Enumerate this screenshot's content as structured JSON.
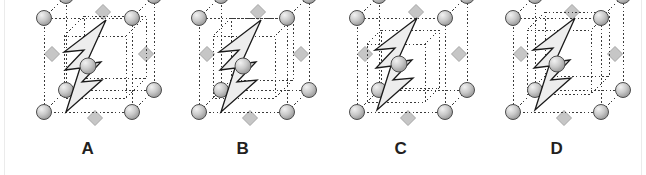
{
  "figure": {
    "background_color": "#ffffff",
    "width": 646,
    "height": 175,
    "edge_rule_color": "#ebebeb"
  },
  "style": {
    "sphere_fill_light": "#f2f2f2",
    "sphere_fill_mid": "#c9c9c9",
    "sphere_fill_dark": "#9a9a9a",
    "sphere_stroke": "#4d4d4d",
    "diamond_fill": "#c6c6c6",
    "diamond_stroke": "#a6a6a6",
    "cell_line_color": "#3a3a3a",
    "bolt_fill": "#ededed",
    "bolt_stroke": "#1a1a1a",
    "label_color": "#231f20"
  },
  "panels": [
    {
      "id": "panel-a",
      "label": "A",
      "left": 8,
      "outer_cell": {
        "x": 36,
        "y": 18,
        "w": 88,
        "h": 94,
        "shear_x": -22,
        "shear_y": 22
      },
      "inner_cell": {
        "x": 56,
        "y": 36,
        "w": 62,
        "h": 62,
        "shear_x": -20,
        "shear_y": 20
      },
      "corner_spheres": 8,
      "face_diamonds": 4,
      "bolt": {
        "cx": 80,
        "cy": 66,
        "scale": 1.0
      },
      "center_sphere": true
    },
    {
      "id": "panel-b",
      "label": "B",
      "left": 163,
      "outer_cell": {
        "x": 36,
        "y": 18,
        "w": 88,
        "h": 94,
        "shear_x": -22,
        "shear_y": 22
      },
      "inner_cell": {
        "x": 50,
        "y": 36,
        "w": 62,
        "h": 62,
        "shear_x": -18,
        "shear_y": 18
      },
      "corner_spheres": 8,
      "face_diamonds": 4,
      "bolt": {
        "cx": 80,
        "cy": 66,
        "scale": 1.0
      },
      "center_sphere": true
    },
    {
      "id": "panel-c",
      "label": "C",
      "left": 321,
      "outer_cell": {
        "x": 36,
        "y": 18,
        "w": 88,
        "h": 94,
        "shear_x": -22,
        "shear_y": 22
      },
      "inner_cell": {
        "x": 46,
        "y": 44,
        "w": 58,
        "h": 58,
        "shear_x": -14,
        "shear_y": 14
      },
      "corner_spheres": 8,
      "face_diamonds": 4,
      "bolt": {
        "cx": 78,
        "cy": 64,
        "scale": 1.0
      },
      "center_sphere": true
    },
    {
      "id": "panel-d",
      "label": "D",
      "left": 477,
      "outer_cell": {
        "x": 36,
        "y": 18,
        "w": 88,
        "h": 94,
        "shear_x": -22,
        "shear_y": 22
      },
      "inner_cell": {
        "x": 50,
        "y": 30,
        "w": 64,
        "h": 64,
        "shear_x": -18,
        "shear_y": 18
      },
      "corner_spheres": 8,
      "face_diamonds": 4,
      "bolt": {
        "cx": 80,
        "cy": 64,
        "scale": 1.0
      },
      "center_sphere": true
    }
  ]
}
